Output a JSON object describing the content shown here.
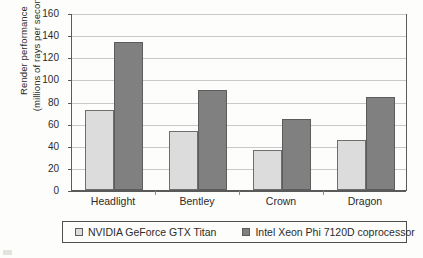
{
  "chart_data": {
    "type": "bar",
    "title": "",
    "xlabel": "",
    "ylabel": "Render performance (millions of rays per second)",
    "ylabel_line1": "Render performance",
    "ylabel_line2": "(millions of rays per second)",
    "categories": [
      "Headlight",
      "Bentley",
      "Crown",
      "Dragon"
    ],
    "series": [
      {
        "name": "NVIDIA GeForce GTX Titan",
        "color": "#dcdcdc",
        "values": [
          72,
          53,
          36,
          45
        ]
      },
      {
        "name": "Intel Xeon Phi 7120D coprocessor",
        "color": "#808080",
        "values": [
          134,
          90,
          64,
          84
        ]
      }
    ],
    "ylim": [
      0,
      160
    ],
    "ytick_step": 20,
    "yticks": [
      160,
      140,
      120,
      100,
      80,
      60,
      40,
      20,
      0
    ],
    "ytick_labels": [
      "160",
      "140",
      "120",
      "100",
      "80",
      "60",
      "40",
      "20",
      "0"
    ],
    "grid": "horizontal",
    "legend_position": "bottom",
    "legend_border": true
  },
  "legend": {
    "items": [
      {
        "label": "NVIDIA GeForce GTX Titan",
        "color": "#dcdcdc"
      },
      {
        "label": "Intel Xeon Phi 7120D coprocessor",
        "color": "#808080"
      }
    ]
  },
  "colors": {
    "series_light": "#dcdcdc",
    "series_dark": "#808080",
    "grid": "#c9c9c9",
    "axis": "#5a5a5a",
    "background": "#fdfdfb",
    "text": "#2b2b2b"
  }
}
